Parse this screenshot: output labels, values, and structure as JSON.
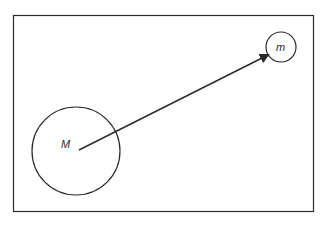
{
  "diagram": {
    "large_mass_label": "M",
    "small_mass_label": "m",
    "stroke_color": "#2a2a2a",
    "background": "#ffffff"
  }
}
